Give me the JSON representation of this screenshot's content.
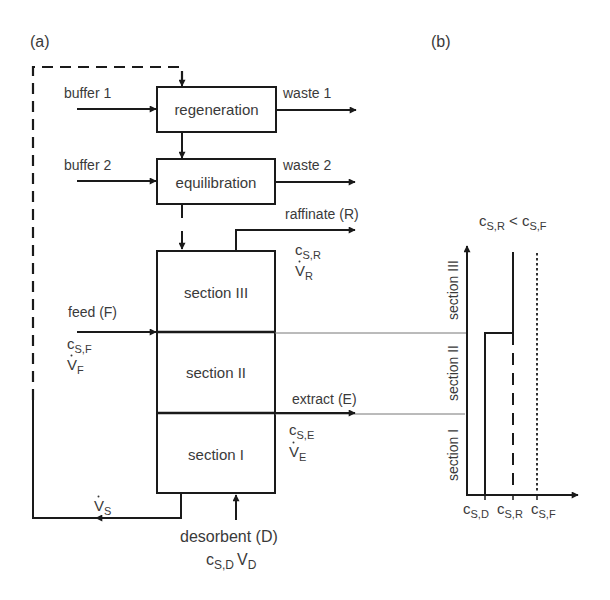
{
  "panel_a": {
    "label": "(a)",
    "units": {
      "regeneration": "regeneration",
      "equilibration": "equilibration"
    },
    "inputs": {
      "buffer1": "buffer 1",
      "buffer2": "buffer 2",
      "feed": "feed (F)",
      "feed_conc": "c",
      "feed_conc_sub": "S,F",
      "feed_flow": "V",
      "feed_flow_sub": "F",
      "desorbent": "desorbent (D)",
      "desorbent_conc": "c",
      "desorbent_conc_sub": "S,D",
      "desorbent_flow": "V",
      "desorbent_flow_sub": "D"
    },
    "outputs": {
      "waste1": "waste 1",
      "waste2": "waste 2",
      "raffinate": "raffinate (R)",
      "raffinate_conc": "c",
      "raffinate_conc_sub": "S,R",
      "raffinate_flow": "V",
      "raffinate_flow_sub": "R",
      "extract": "extract (E)",
      "extract_conc": "c",
      "extract_conc_sub": "S,E",
      "extract_flow": "V",
      "extract_flow_sub": "E"
    },
    "sections": {
      "s3": "section III",
      "s2": "section II",
      "s1": "section I"
    },
    "recycle": {
      "flow": "V",
      "flow_sub": "S"
    }
  },
  "panel_b": {
    "label": "(b)",
    "condition": "c",
    "condition_sub1": "S,R",
    "condition_op": " < c",
    "condition_sub2": "S,F",
    "y_sections": [
      "section I",
      "section II",
      "section III"
    ],
    "x_ticks": [
      {
        "c": "c",
        "sub": "S,D"
      },
      {
        "c": "c",
        "sub": "S,R"
      },
      {
        "c": "c",
        "sub": "S,F"
      }
    ]
  },
  "colors": {
    "line": "#1a1a1a",
    "text": "#3a3a3a",
    "thin_line": "#777777"
  }
}
